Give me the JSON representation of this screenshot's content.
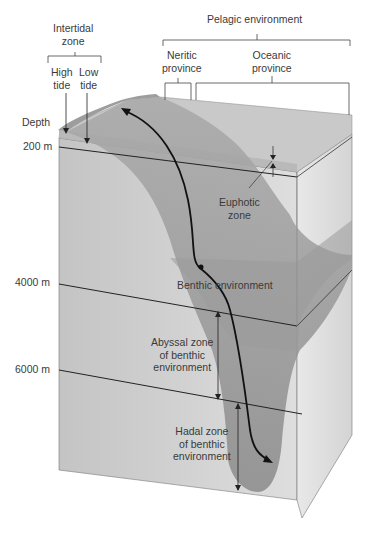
{
  "diagram": {
    "labels": {
      "pelagic": "Pelagic environment",
      "intertidal_line1": "Intertidal",
      "intertidal_line2": "zone",
      "high_tide_line1": "High",
      "high_tide_line2": "tide",
      "low_tide_line1": "Low",
      "low_tide_line2": "tide",
      "neritic_line1": "Neritic",
      "neritic_line2": "province",
      "oceanic_line1": "Oceanic",
      "oceanic_line2": "province",
      "euphotic_line1": "Euphotic",
      "euphotic_line2": "zone",
      "benthic": "Benthic environment",
      "abyssal_line1": "Abyssal zone",
      "abyssal_line2": "of benthic",
      "abyssal_line3": "environment",
      "hadal_line1": "Hadal zone",
      "hadal_line2": "of benthic",
      "hadal_line3": "environment"
    },
    "depth_axis": {
      "title": "Depth",
      "ticks": [
        "200 m",
        "4000 m",
        "6000 m"
      ]
    },
    "colors": {
      "block_light": "#d9d9d9",
      "block_mid": "#bdbdbd",
      "seafloor_dark": "#8f8f8f",
      "water_surface": "#c8c8c8",
      "line": "#222222"
    }
  }
}
